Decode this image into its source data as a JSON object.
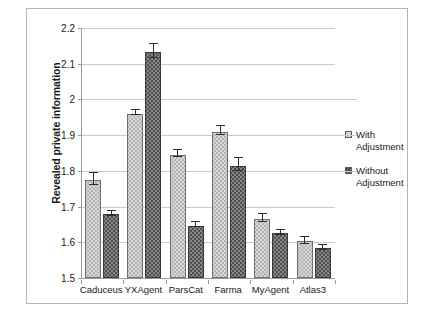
{
  "chart_data": {
    "type": "bar",
    "title": "",
    "xlabel": "",
    "ylabel": "Revealed private information",
    "ylim": [
      1.5,
      2.2
    ],
    "ytick_labels": [
      "2.2",
      "2.1",
      "2",
      "1.9",
      "1.8",
      "1.7",
      "1.6",
      "1.5"
    ],
    "ytick_values": [
      2.2,
      2.1,
      2.0,
      1.9,
      1.8,
      1.7,
      1.6,
      1.5
    ],
    "grid": true,
    "legend_position": "right",
    "categories": [
      "Caduceus",
      "YXAgent",
      "ParsCat",
      "Farma",
      "MyAgent",
      "Atlas3"
    ],
    "series": [
      {
        "name": "With Adjustment",
        "color": "#d9d9d9",
        "values": [
          1.775,
          1.96,
          1.845,
          1.91,
          1.665,
          1.603
        ],
        "errors": [
          0.016,
          0.007,
          0.01,
          0.013,
          0.012,
          0.01
        ]
      },
      {
        "name": "Without Adjustment",
        "color": "#4d4d4d",
        "values": [
          1.678,
          2.133,
          1.646,
          1.815,
          1.625,
          1.583
        ],
        "errors": [
          0.006,
          0.02,
          0.007,
          0.018,
          0.006,
          0.006
        ]
      }
    ]
  },
  "legend": {
    "items": [
      {
        "label_line1": "With",
        "label_line2": "Adjustment",
        "swatch": "light"
      },
      {
        "label_line1": "Without",
        "label_line2": "Adjustment",
        "swatch": "dark"
      }
    ]
  },
  "axis": {
    "y_title": "Revealed private information"
  }
}
